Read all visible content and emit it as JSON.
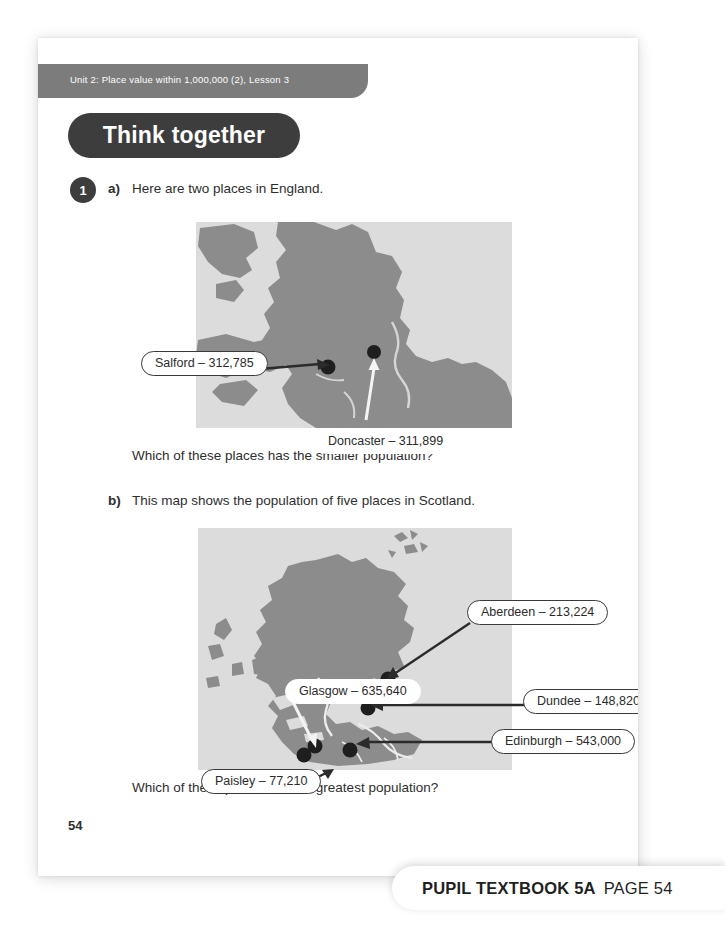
{
  "page": {
    "unit_banner": "Unit 2: Place value within 1,000,000 (2), Lesson 3",
    "section_title": "Think together",
    "question_number": "1",
    "page_number": "54"
  },
  "question": {
    "part_a": {
      "label": "a)",
      "prompt": "Here are two places in England.",
      "follow_up": "Which of these places has the smaller population?"
    },
    "part_b": {
      "label": "b)",
      "prompt": "This map shows the population of five places in Scotland.",
      "follow_up": "Which of these places has the greatest population?"
    }
  },
  "maps": {
    "england": {
      "places": [
        {
          "name": "Salford",
          "population": "312,785",
          "label": "Salford – 312,785"
        },
        {
          "name": "Doncaster",
          "population": "311,899",
          "label": "Doncaster – 311,899"
        }
      ]
    },
    "scotland": {
      "places": [
        {
          "name": "Aberdeen",
          "population": "213,224",
          "label": "Aberdeen – 213,224"
        },
        {
          "name": "Glasgow",
          "population": "635,640",
          "label": "Glasgow – 635,640"
        },
        {
          "name": "Dundee",
          "population": "148,820",
          "label": "Dundee – 148,820"
        },
        {
          "name": "Edinburgh",
          "population": "543,000",
          "label": "Edinburgh – 543,000"
        },
        {
          "name": "Paisley",
          "population": "77,210",
          "label": "Paisley – 77,210"
        }
      ]
    }
  },
  "footer": {
    "book": "PUPIL TEXTBOOK 5A",
    "page_ref": "PAGE 54"
  },
  "colors": {
    "banner_gray": "#7c7c7c",
    "pill_dark": "#3d3d3d",
    "map_sea": "#dcdcdc",
    "map_land": "#8c8c8c",
    "text": "#2e2e2e"
  }
}
